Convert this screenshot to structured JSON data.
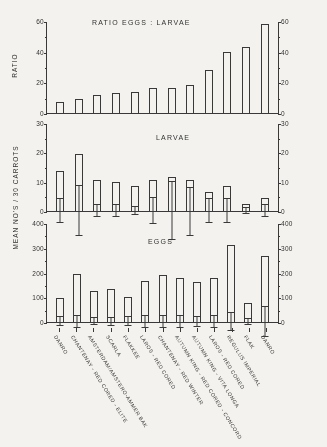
{
  "figure": {
    "y_axis_label_top": "RATIO",
    "y_axis_label_bottom": "MEAN  NO'S / 30  CARROTS"
  },
  "chart_data": [
    {
      "type": "bar",
      "title": "RATIO  EGGS : LARVAE",
      "xlabel": "",
      "ylabel": "RATIO",
      "ylim": [
        0,
        60
      ],
      "yticks": [
        0,
        20,
        40,
        60
      ],
      "grid": false,
      "legend": "none",
      "categories": [
        "DANRO",
        "CHANTENAY - RED CORED - ELITE",
        "AMSTERDAM/AMSTERO-AMMER BAK",
        "SCARLA",
        "FLAKKEE",
        "LAROS - RED CORED",
        "CHANTENAY - RED WINTER",
        "AUTUMN KING - RED CORED - CONCORD",
        "AUTUMN KING - VITA LONGA",
        "LAROS - RED CORED",
        "REGULUS IMPERIAL",
        "FLAK"
      ],
      "values": [
        7,
        9,
        12,
        13,
        14,
        16,
        16,
        18,
        28,
        40,
        43,
        58
      ]
    },
    {
      "type": "bar",
      "title": "LARVAE",
      "xlabel": "",
      "ylabel": "MEAN  NO'S / 30  CARROTS",
      "ylim": [
        0,
        30
      ],
      "yticks": [
        0,
        10,
        20,
        30
      ],
      "grid": false,
      "legend": "none",
      "error_bars": true,
      "categories": [
        "DANRO",
        "CHANTENAY - RED CORED - ELITE",
        "AMSTERDAM/AMSTERO-AMMER BAK",
        "SCARLA",
        "FLAKKEE",
        "LAROS - RED CORED",
        "CHANTENAY - RED WINTER",
        "AUTUMN KING - RED CORED - CONCORD",
        "AUTUMN KING - VITA LONGA",
        "LAROS - RED CORED",
        "REGULUS IMPERIAL",
        "FLAK"
      ],
      "values": [
        13.5,
        19.5,
        10.5,
        10.0,
        8.5,
        10.5,
        11.5,
        10.5,
        6.5,
        8.5,
        2.5,
        4.5
      ],
      "err_upper": [
        17.5,
        28.0,
        12.5,
        12.0,
        10.0,
        15.0,
        21.5,
        18.5,
        10.5,
        12.5,
        3.5,
        6.5
      ],
      "err_lower": [
        9.5,
        11.0,
        8.5,
        8.0,
        7.0,
        6.0,
        1.5,
        2.0,
        2.5,
        4.5,
        1.5,
        2.5
      ]
    },
    {
      "type": "bar",
      "title": "EGGS",
      "xlabel": "",
      "ylabel": "MEAN  NO'S / 30  CARROTS",
      "ylim": [
        0,
        400
      ],
      "yticks": [
        0,
        100,
        200,
        300,
        400
      ],
      "grid": false,
      "legend": "none",
      "error_bars": true,
      "categories": [
        "DANRO",
        "CHANTENAY - RED CORED - ELITE",
        "AMSTERDAM/AMSTERO-AMMER BAK",
        "SCARLA",
        "FLAKKEE",
        "LAROS - RED CORED",
        "CHANTENAY - RED WINTER",
        "AUTUMN KING - RED CORED - CONCORD",
        "AUTUMN KING - VITA LONGA",
        "LAROS - RED CORED",
        "REGULUS IMPERIAL",
        "FLAK"
      ],
      "values": [
        98,
        192,
        124,
        133,
        103,
        166,
        191,
        176,
        161,
        178,
        310,
        75,
        268
      ],
      "err_upper": [
        118,
        218,
        140,
        150,
        124,
        192,
        215,
        200,
        183,
        203,
        345,
        88,
        330
      ],
      "err_lower": [
        80,
        168,
        110,
        118,
        85,
        142,
        168,
        152,
        140,
        155,
        275,
        62,
        208
      ]
    }
  ],
  "x_categories": [
    "DANRO",
    "CHANTENAY - RED CORED - ELITE",
    "AMSTERDAM/AMSTERO-AMMER BAK",
    "SCARLA",
    "FLAKKEE",
    "LAROS - RED CORED",
    "CHANTENAY - RED WINTER",
    "AUTUMN KING - RED CORED - CONCORD",
    "AUTUMN KING - VITA LONGA",
    "LAROS - RED CORED",
    "REGULUS IMPERIAL",
    "FLAK"
  ]
}
